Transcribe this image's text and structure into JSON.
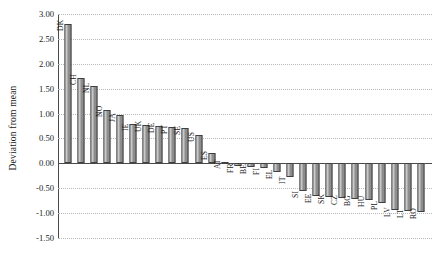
{
  "chart_data": {
    "type": "bar",
    "title": "",
    "xlabel": "",
    "ylabel": "Deviation from mean",
    "ylim": [
      -1.5,
      3.0
    ],
    "ytick_step": 0.5,
    "grid": true,
    "legend": "none",
    "orientation": "vertical",
    "bar_color": "#8d8d8d",
    "bar_edge_color": "#3f3f3f",
    "categories": [
      "DK",
      "CH",
      "NL",
      "NO",
      "JA",
      "IE",
      "UK",
      "DE",
      "PT",
      "SE",
      "US",
      "ES",
      "AT",
      "FR",
      "BE",
      "FI",
      "EL",
      "IT",
      "SI",
      "EE",
      "SK",
      "CZ",
      "BG",
      "HU",
      "PL",
      "LV",
      "LT",
      "RO"
    ],
    "values": [
      2.8,
      1.72,
      1.55,
      1.07,
      0.98,
      0.8,
      0.78,
      0.76,
      0.72,
      0.7,
      0.57,
      0.2,
      0.03,
      -0.06,
      -0.08,
      -0.09,
      -0.18,
      -0.27,
      -0.55,
      -0.66,
      -0.68,
      -0.7,
      -0.71,
      -0.73,
      -0.8,
      -0.93,
      -0.95,
      -0.97
    ],
    "ytick_labels": [
      "3.00",
      "2.50",
      "2.00",
      "1.50",
      "1.00",
      "0.50",
      "0.00",
      "-0.50",
      "-1.00",
      "-1.50"
    ],
    "ytick_values": [
      3.0,
      2.5,
      2.0,
      1.5,
      1.0,
      0.5,
      0.0,
      -0.5,
      -1.0,
      -1.5
    ]
  }
}
